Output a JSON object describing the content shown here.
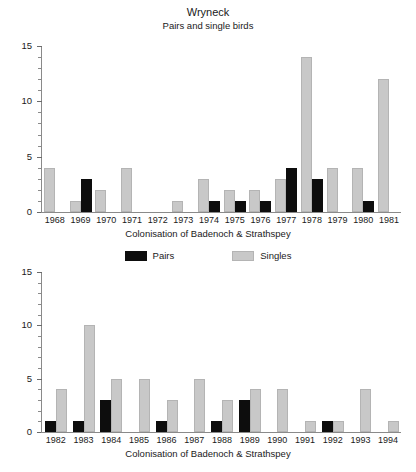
{
  "header": {
    "title": "Wryneck",
    "subtitle": "Pairs and single birds"
  },
  "legend": {
    "pairs_label": "Pairs",
    "singles_label": "Singles",
    "pairs_color": "#0d0d0d",
    "singles_color": "#c8c8c8"
  },
  "chart_data": [
    {
      "type": "bar",
      "id": "top",
      "title": "Wryneck",
      "subtitle": "Pairs and single birds",
      "xlabel": "Colonisation of Badenoch & Strathspey",
      "ylabel": "",
      "ylim": [
        0,
        15
      ],
      "yticks": [
        0,
        5,
        10,
        15
      ],
      "ytick_labels": [
        "0",
        "5",
        "10",
        "15"
      ],
      "minor_tick_step": 1,
      "grid": false,
      "legend_position": "below-axis",
      "categories": [
        "1968",
        "1969",
        "1970",
        "1971",
        "1972",
        "1973",
        "1974",
        "1975",
        "1976",
        "1977",
        "1978",
        "1979",
        "1980",
        "1981"
      ],
      "series": [
        {
          "name": "Singles",
          "color": "#c8c8c8",
          "values": [
            4,
            1,
            2,
            4,
            0,
            1,
            3,
            2,
            2,
            3,
            14,
            4,
            4,
            12
          ]
        },
        {
          "name": "Pairs",
          "color": "#0d0d0d",
          "values": [
            0,
            3,
            0,
            0,
            0,
            0,
            1,
            1,
            1,
            4,
            3,
            0,
            1,
            0
          ]
        }
      ]
    },
    {
      "type": "bar",
      "id": "bottom",
      "title": "",
      "subtitle": "",
      "xlabel": "Colonisation of Badenoch & Strathspey",
      "ylabel": "",
      "ylim": [
        0,
        15
      ],
      "yticks": [
        0,
        5,
        10,
        15
      ],
      "ytick_labels": [
        "0",
        "5",
        "10",
        "15"
      ],
      "minor_tick_step": 1,
      "grid": false,
      "legend_position": "above-chart",
      "categories": [
        "1982",
        "1983",
        "1984",
        "1985",
        "1986",
        "1987",
        "1988",
        "1989",
        "1990",
        "1991",
        "1992",
        "1993",
        "1994"
      ],
      "series": [
        {
          "name": "Pairs",
          "color": "#0d0d0d",
          "values": [
            1,
            1,
            3,
            0,
            1,
            0,
            1,
            3,
            0,
            0,
            1,
            0,
            0
          ]
        },
        {
          "name": "Singles",
          "color": "#c8c8c8",
          "values": [
            4,
            10,
            5,
            5,
            3,
            5,
            3,
            4,
            4,
            1,
            1,
            4,
            1
          ]
        }
      ]
    }
  ]
}
